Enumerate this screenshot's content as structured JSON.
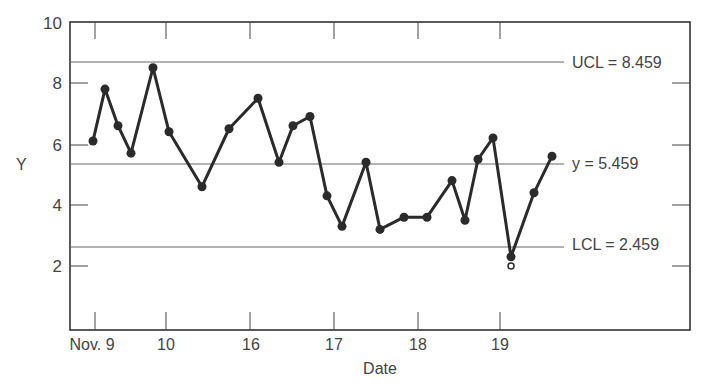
{
  "chart_data": {
    "type": "line",
    "title": "",
    "xlabel": "Date",
    "ylabel": "Y",
    "ylim": [
      0,
      10
    ],
    "y_ticks": [
      2,
      4,
      6,
      8,
      10
    ],
    "x_tick_labels": [
      "Nov. 9",
      "10",
      "16",
      "17",
      "18",
      "19"
    ],
    "grid": false,
    "control_lines": [
      {
        "name": "UCL",
        "label": "UCL = 8.459",
        "value": 8.459
      },
      {
        "name": "center",
        "label": "y = 5.459",
        "value": 5.459
      },
      {
        "name": "LCL",
        "label": "LCL = 2.459",
        "value": 2.459
      }
    ],
    "series": [
      {
        "name": "Y",
        "marker": "filled-circle",
        "values": [
          6.1,
          7.8,
          6.6,
          5.7,
          8.5,
          6.4,
          4.6,
          6.5,
          7.5,
          5.4,
          6.6,
          6.9,
          4.3,
          3.3,
          5.4,
          3.2,
          3.6,
          3.6,
          4.8,
          3.5,
          5.5,
          6.2,
          2.3,
          4.4,
          5.6
        ]
      }
    ],
    "annotations": [
      {
        "type": "open-circle",
        "near_point_index": 22,
        "value": 2.0,
        "note": "out-of-control marker below LCL"
      }
    ]
  },
  "labels": {
    "y_axis": "Y",
    "x_axis": "Date",
    "ucl": "UCL = 8.459",
    "center": "y = 5.459",
    "lcl": "LCL = 2.459",
    "y_ticks": [
      "2",
      "4",
      "6",
      "8",
      "10"
    ],
    "x_ticks": [
      "Nov. 9",
      "10",
      "16",
      "17",
      "18",
      "19"
    ]
  }
}
